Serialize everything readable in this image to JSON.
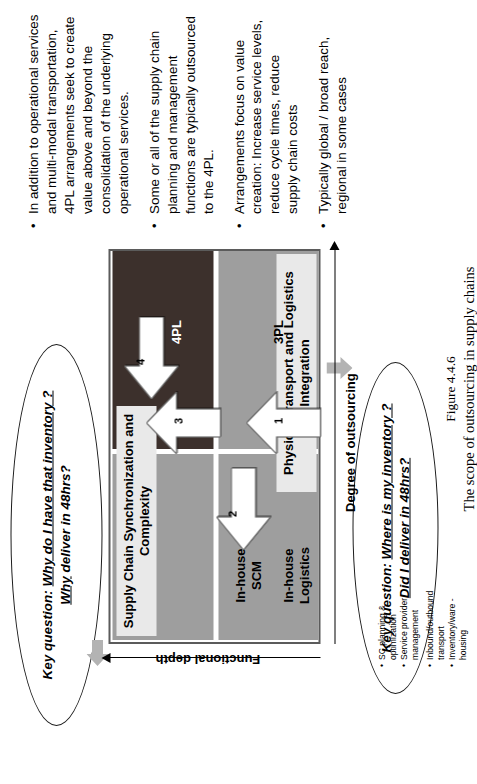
{
  "figure": {
    "caption_number": "Figure 4.4.6",
    "caption_text": "The scope of outsourcing in supply chains"
  },
  "colors": {
    "quadrant_gray": "#9e9e9e",
    "quadrant_dark": "#3c302c",
    "banner_bg": "#e9e9e9",
    "matrix_border": "#5b5b5b",
    "arrow_fill": "#ffffff",
    "gray_pointer": "#b3b3b3"
  },
  "callouts": {
    "top": {
      "prefix": "Key question:",
      "line1": "Why do I have that inventory ?",
      "line2": "Why",
      "line2_rest": " deliver in 48hrs?"
    },
    "bottom": {
      "prefix": "Key question:",
      "line1": "Where is my inventory ?",
      "line2": "Did I deliver in 48hrs?"
    }
  },
  "matrix": {
    "banner_top": "Supply Chain Synchronization and\nComplexity",
    "banner_bottom": "Physical Transport and Logistics\nIntegration",
    "quadrants": [
      {
        "id": "in-house-scm",
        "label": "In-house\nSCM",
        "fill": "gray"
      },
      {
        "id": "4pl",
        "label": "4PL",
        "fill": "dark"
      },
      {
        "id": "in-house-logistics",
        "label": "In-house\nLogistics",
        "fill": "gray"
      },
      {
        "id": "3pl",
        "label": "3PL",
        "fill": "gray"
      }
    ],
    "arrows": [
      {
        "num": "1",
        "direction": "up",
        "from": "In-house Logistics",
        "to": "3PL"
      },
      {
        "num": "2",
        "direction": "left",
        "from": "In-house Logistics",
        "to": "In-house SCM"
      },
      {
        "num": "3",
        "direction": "up",
        "from": "In-house SCM",
        "to": "4PL"
      },
      {
        "num": "4",
        "direction": "left",
        "from": "3PL",
        "to": "4PL"
      }
    ],
    "axis_y": "Functional depth",
    "axis_x": "Degree of outsourcing"
  },
  "bullets_main": [
    "In addition to operational services and multi-modal transportation, 4PL arrangements seek to create value above and beyond the consolidation of the underlying operational services.",
    "Some or all of the supply chain planning and management functions are typically outsourced to the 4PL.",
    "Arrangements focus on value creation: Increase service levels, reduce cycle times, reduce supply chain costs",
    "Typically global / broad reach, regional in some cases"
  ],
  "mini_bullets_left": [
    "SC planning & optimization",
    "Service provider management"
  ],
  "mini_bullets_right": [
    "Inbound/outbound transport",
    "Inventory/ware - housing"
  ],
  "icons": {
    "bullet": "•"
  }
}
